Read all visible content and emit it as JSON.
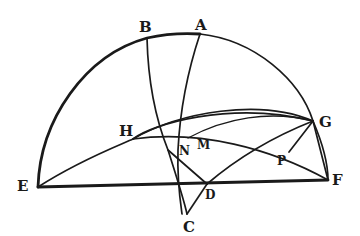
{
  "figure": {
    "labels": {
      "A": "A",
      "B": "B",
      "C": "C",
      "D": "D",
      "E": "E",
      "F": "F",
      "G": "G",
      "H": "H",
      "M": "M",
      "N": "N",
      "P": "P"
    },
    "ink_color": "#1a1a1a",
    "paper_color": "#ffffff"
  }
}
